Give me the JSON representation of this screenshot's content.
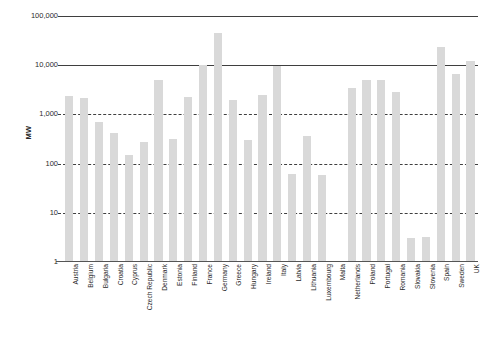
{
  "chart_data": {
    "type": "bar",
    "title": "",
    "xlabel": "",
    "ylabel": "MW",
    "yscale": "log",
    "ylim": [
      1,
      100000
    ],
    "grid": true,
    "legend": false,
    "bar_color": "#d9d9d9",
    "ytick_labels": [
      "100,000",
      "10,000",
      "1,000",
      "100",
      "10",
      "1"
    ],
    "yticks": [
      100000,
      10000,
      1000,
      100,
      10,
      1
    ],
    "categories": [
      "Austria",
      "Belgium",
      "Bulgaria",
      "Croatia",
      "Cyprus",
      "Czech Republic",
      "Denmark",
      "Estonia",
      "Finland",
      "France",
      "Germany",
      "Greece",
      "Hungary",
      "Ireland",
      "Italy",
      "Latvia",
      "Lithuania",
      "Luxembourg",
      "Malta",
      "Netherlands",
      "Poland",
      "Portugal",
      "Romania",
      "Slovakia",
      "Slovenia",
      "Spain",
      "Sweden",
      "UK"
    ],
    "values": [
      2400,
      2200,
      700,
      420,
      150,
      280,
      5000,
      310,
      2300,
      10200,
      45000,
      2000,
      300,
      2450,
      9500,
      62,
      370,
      58,
      0,
      3400,
      5100,
      5000,
      2800,
      3.1,
      3.3,
      23000,
      6500,
      12000
    ]
  }
}
